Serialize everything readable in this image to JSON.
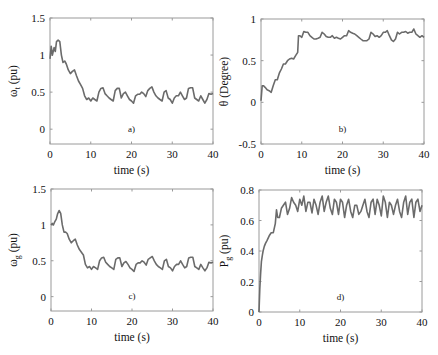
{
  "figure": {
    "line_color": "#6b6b6b",
    "axis_color": "#9a9a9a",
    "background": "#ffffff"
  },
  "chart_data": [
    {
      "id": "a",
      "type": "line",
      "panel_label": "a)",
      "title": "",
      "xlabel": "time (s)",
      "ylabel": "ω_t (pu)",
      "ylabel_main": "ω",
      "ylabel_sub": "t",
      "ylabel_unit": "(pu)",
      "xlim": [
        0,
        40
      ],
      "ylim": [
        -0.2,
        1.5
      ],
      "xticks": [
        0,
        10,
        20,
        30,
        40
      ],
      "xtick_labels": [
        "0",
        "10",
        "20",
        "30",
        "40"
      ],
      "yticks": [
        0,
        0.5,
        1,
        1.5
      ],
      "ytick_labels": [
        "0",
        "0.5",
        "1",
        "1.5"
      ],
      "grid": false,
      "box": {
        "x": 50,
        "y": 18,
        "w": 163,
        "h": 126
      },
      "series": [
        {
          "name": "omega_t",
          "x": [
            0,
            0.3,
            0.6,
            1,
            1.3,
            1.6,
            2,
            2.4,
            2.8,
            3.2,
            3.6,
            4,
            4.5,
            5,
            5.5,
            6,
            6.5,
            7,
            7.5,
            8,
            8.5,
            9,
            9.5,
            10,
            10.5,
            11,
            11.5,
            12,
            12.5,
            13,
            13.5,
            14,
            14.5,
            15,
            15.5,
            16,
            16.5,
            17,
            17.5,
            18,
            18.5,
            19,
            19.5,
            20,
            20.5,
            21,
            21.5,
            22,
            22.5,
            23,
            23.5,
            24,
            24.5,
            25,
            25.5,
            26,
            26.5,
            27,
            27.5,
            28,
            28.5,
            29,
            29.5,
            30,
            30.5,
            31,
            31.5,
            32,
            32.5,
            33,
            33.5,
            34,
            34.5,
            35,
            35.5,
            36,
            36.5,
            37,
            37.5,
            38,
            38.5,
            39,
            39.5,
            40
          ],
          "values": [
            0.95,
            1.12,
            1.0,
            1.1,
            1.05,
            1.18,
            1.2,
            1.18,
            1.0,
            0.9,
            0.92,
            0.88,
            0.8,
            0.75,
            0.78,
            0.8,
            0.72,
            0.65,
            0.6,
            0.55,
            0.45,
            0.4,
            0.42,
            0.38,
            0.42,
            0.4,
            0.38,
            0.5,
            0.55,
            0.56,
            0.48,
            0.45,
            0.42,
            0.4,
            0.38,
            0.52,
            0.55,
            0.55,
            0.42,
            0.48,
            0.5,
            0.45,
            0.4,
            0.38,
            0.35,
            0.45,
            0.47,
            0.47,
            0.5,
            0.48,
            0.44,
            0.52,
            0.55,
            0.57,
            0.5,
            0.45,
            0.42,
            0.4,
            0.38,
            0.5,
            0.52,
            0.42,
            0.4,
            0.35,
            0.42,
            0.45,
            0.45,
            0.5,
            0.45,
            0.4,
            0.42,
            0.55,
            0.56,
            0.56,
            0.42,
            0.4,
            0.38,
            0.45,
            0.4,
            0.35,
            0.4,
            0.48,
            0.47,
            0.48
          ]
        }
      ]
    },
    {
      "id": "b",
      "type": "line",
      "panel_label": "b)",
      "title": "",
      "xlabel": "time (s)",
      "ylabel": "θ (Degree)",
      "xlim": [
        0,
        40
      ],
      "ylim": [
        -0.5,
        1
      ],
      "xticks": [
        0,
        10,
        20,
        30,
        40
      ],
      "xtick_labels": [
        "0",
        "10",
        "20",
        "30",
        "40"
      ],
      "yticks": [
        -0.5,
        0,
        0.5,
        1
      ],
      "ytick_labels": [
        "-0.5",
        "0",
        "0.5",
        "1"
      ],
      "grid": false,
      "box": {
        "x": 261,
        "y": 19,
        "w": 163,
        "h": 125
      },
      "series": [
        {
          "name": "theta",
          "x": [
            0,
            0.3,
            0.6,
            1,
            1.5,
            2,
            2.5,
            3,
            3.5,
            4,
            4.5,
            5,
            5.5,
            6,
            6.5,
            7,
            7.5,
            8,
            8.5,
            9,
            9.2,
            9.5,
            10,
            10.5,
            11,
            11.5,
            12,
            12.5,
            13,
            13.5,
            14,
            14.5,
            15,
            15.5,
            16,
            16.5,
            17,
            17.5,
            18,
            18.5,
            19,
            19.5,
            20,
            20.5,
            21,
            21.5,
            22,
            22.5,
            23,
            23.5,
            24,
            24.5,
            25,
            25.5,
            26,
            26.5,
            27,
            27.5,
            28,
            28.5,
            29,
            29.5,
            30,
            30.5,
            31,
            31.5,
            32,
            32.5,
            33,
            33.5,
            34,
            34.5,
            35,
            35.5,
            36,
            36.5,
            37,
            37.5,
            38,
            38.5,
            39,
            39.5,
            40
          ],
          "values": [
            0.02,
            0.2,
            0.2,
            0.18,
            0.15,
            0.14,
            0.12,
            0.2,
            0.27,
            0.27,
            0.35,
            0.4,
            0.46,
            0.46,
            0.5,
            0.52,
            0.53,
            0.52,
            0.56,
            0.6,
            0.8,
            0.8,
            0.78,
            0.85,
            0.84,
            0.84,
            0.8,
            0.78,
            0.76,
            0.76,
            0.77,
            0.78,
            0.84,
            0.82,
            0.79,
            0.78,
            0.78,
            0.8,
            0.77,
            0.78,
            0.77,
            0.76,
            0.78,
            0.8,
            0.8,
            0.86,
            0.84,
            0.83,
            0.82,
            0.8,
            0.78,
            0.76,
            0.74,
            0.74,
            0.74,
            0.76,
            0.84,
            0.82,
            0.79,
            0.8,
            0.78,
            0.8,
            0.84,
            0.84,
            0.86,
            0.8,
            0.75,
            0.73,
            0.76,
            0.84,
            0.82,
            0.84,
            0.84,
            0.85,
            0.83,
            0.84,
            0.84,
            0.88,
            0.82,
            0.8,
            0.78,
            0.8,
            0.78
          ]
        }
      ]
    },
    {
      "id": "c",
      "type": "line",
      "panel_label": "c)",
      "title": "",
      "xlabel": "time (s)",
      "ylabel": "ω_g (pu)",
      "ylabel_main": "ω",
      "ylabel_sub": "g",
      "ylabel_unit": "(pu)",
      "xlim": [
        0,
        40
      ],
      "ylim": [
        -0.2,
        1.5
      ],
      "xticks": [
        0,
        10,
        20,
        30,
        40
      ],
      "xtick_labels": [
        "0",
        "10",
        "20",
        "30",
        "40"
      ],
      "yticks": [
        0,
        0.5,
        1,
        1.5
      ],
      "ytick_labels": [
        "0",
        "0.5",
        "1",
        "1.5"
      ],
      "grid": false,
      "box": {
        "x": 51,
        "y": 189,
        "w": 162,
        "h": 122
      },
      "series": [
        {
          "name": "omega_g",
          "x": [
            0,
            0.3,
            0.6,
            1,
            1.3,
            1.6,
            2,
            2.4,
            2.8,
            3.2,
            3.6,
            4,
            4.5,
            5,
            5.5,
            6,
            6.5,
            7,
            7.5,
            8,
            8.5,
            9,
            9.5,
            10,
            10.5,
            11,
            11.5,
            12,
            12.5,
            13,
            13.5,
            14,
            14.5,
            15,
            15.5,
            16,
            16.5,
            17,
            17.5,
            18,
            18.5,
            19,
            19.5,
            20,
            20.5,
            21,
            21.5,
            22,
            22.5,
            23,
            23.5,
            24,
            24.5,
            25,
            25.5,
            26,
            26.5,
            27,
            27.5,
            28,
            28.5,
            29,
            29.5,
            30,
            30.5,
            31,
            31.5,
            32,
            32.5,
            33,
            33.5,
            34,
            34.5,
            35,
            35.5,
            36,
            36.5,
            37,
            37.5,
            38,
            38.5,
            39,
            39.5,
            40
          ],
          "values": [
            1.0,
            1.02,
            1.0,
            1.05,
            1.08,
            1.15,
            1.2,
            1.16,
            1.0,
            0.9,
            0.9,
            0.88,
            0.8,
            0.75,
            0.78,
            0.8,
            0.72,
            0.66,
            0.62,
            0.58,
            0.45,
            0.4,
            0.42,
            0.38,
            0.42,
            0.4,
            0.38,
            0.5,
            0.54,
            0.55,
            0.48,
            0.45,
            0.42,
            0.4,
            0.38,
            0.52,
            0.54,
            0.54,
            0.42,
            0.47,
            0.49,
            0.45,
            0.4,
            0.38,
            0.35,
            0.45,
            0.47,
            0.47,
            0.5,
            0.48,
            0.44,
            0.52,
            0.54,
            0.56,
            0.5,
            0.45,
            0.42,
            0.4,
            0.38,
            0.5,
            0.52,
            0.42,
            0.4,
            0.36,
            0.42,
            0.45,
            0.45,
            0.5,
            0.45,
            0.4,
            0.42,
            0.54,
            0.55,
            0.55,
            0.42,
            0.4,
            0.38,
            0.45,
            0.4,
            0.36,
            0.4,
            0.48,
            0.47,
            0.48
          ]
        }
      ]
    },
    {
      "id": "d",
      "type": "line",
      "panel_label": "d)",
      "title": "",
      "xlabel": "time (s)",
      "ylabel": "P_g (pu)",
      "ylabel_main": "P",
      "ylabel_sub": "g",
      "ylabel_unit": "(pu)",
      "xlim": [
        0,
        40
      ],
      "ylim": [
        0,
        0.8
      ],
      "xticks": [
        0,
        10,
        20,
        30,
        40
      ],
      "xtick_labels": [
        "0",
        "10",
        "20",
        "30",
        "40"
      ],
      "yticks": [
        0,
        0.2,
        0.4,
        0.6,
        0.8
      ],
      "ytick_labels": [
        "0",
        "0.2",
        "0.4",
        "0.6",
        "0.8"
      ],
      "grid": false,
      "box": {
        "x": 259,
        "y": 190,
        "w": 163,
        "h": 122
      },
      "series": [
        {
          "name": "P_g",
          "x": [
            0,
            0.2,
            0.4,
            0.6,
            0.8,
            1,
            1.3,
            1.6,
            2,
            2.5,
            3,
            3.5,
            4,
            4.3,
            4.6,
            5,
            5.5,
            6,
            6.5,
            7,
            7.5,
            8,
            8.5,
            9,
            9.5,
            10,
            10.5,
            11,
            11.5,
            12,
            12.5,
            13,
            13.5,
            14,
            14.5,
            15,
            15.5,
            16,
            16.5,
            17,
            17.5,
            18,
            18.5,
            19,
            19.5,
            20,
            20.5,
            21,
            21.5,
            22,
            22.5,
            23,
            23.5,
            24,
            24.5,
            25,
            25.5,
            26,
            26.5,
            27,
            27.5,
            28,
            28.5,
            29,
            29.5,
            30,
            30.5,
            31,
            31.5,
            32,
            32.5,
            33,
            33.5,
            34,
            34.5,
            35,
            35.5,
            36,
            36.5,
            37,
            37.5,
            38,
            38.5,
            39,
            39.5,
            40
          ],
          "values": [
            0,
            0.15,
            0.25,
            0.33,
            0.37,
            0.4,
            0.43,
            0.45,
            0.47,
            0.5,
            0.52,
            0.52,
            0.58,
            0.67,
            0.62,
            0.62,
            0.68,
            0.7,
            0.72,
            0.64,
            0.68,
            0.75,
            0.72,
            0.7,
            0.66,
            0.74,
            0.7,
            0.76,
            0.66,
            0.72,
            0.72,
            0.65,
            0.74,
            0.7,
            0.64,
            0.72,
            0.76,
            0.66,
            0.72,
            0.76,
            0.68,
            0.64,
            0.74,
            0.72,
            0.64,
            0.74,
            0.72,
            0.62,
            0.7,
            0.74,
            0.66,
            0.62,
            0.7,
            0.7,
            0.64,
            0.66,
            0.7,
            0.74,
            0.66,
            0.62,
            0.72,
            0.74,
            0.64,
            0.74,
            0.7,
            0.63,
            0.76,
            0.72,
            0.62,
            0.72,
            0.7,
            0.64,
            0.7,
            0.74,
            0.66,
            0.62,
            0.72,
            0.76,
            0.64,
            0.72,
            0.74,
            0.62,
            0.72,
            0.74,
            0.66,
            0.7
          ]
        }
      ]
    }
  ]
}
